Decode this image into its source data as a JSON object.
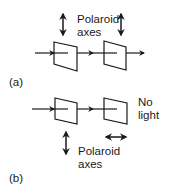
{
  "figure": {
    "panel_a": {
      "label": "(a)",
      "axes_label_line1": "Polaroid",
      "axes_label_line2": "axes",
      "polarizer_1_axis": "vertical",
      "polarizer_2_axis": "vertical",
      "output": "light transmitted"
    },
    "panel_b": {
      "label": "(b)",
      "axes_label_line1": "Polaroid",
      "axes_label_line2": "axes",
      "polarizer_1_axis": "vertical",
      "polarizer_2_axis": "horizontal",
      "output_line1": "No",
      "output_line2": "light"
    },
    "colors": {
      "stroke": "#1a1a1a",
      "background": "#ffffff"
    }
  }
}
